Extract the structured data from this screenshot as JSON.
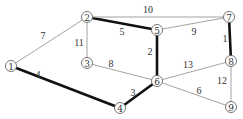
{
  "graph": {
    "nodes": [
      {
        "id": "1",
        "x": 11,
        "y": 66
      },
      {
        "id": "2",
        "x": 87,
        "y": 17
      },
      {
        "id": "3",
        "x": 87,
        "y": 63
      },
      {
        "id": "4",
        "x": 120,
        "y": 108
      },
      {
        "id": "5",
        "x": 157,
        "y": 30
      },
      {
        "id": "6",
        "x": 157,
        "y": 81
      },
      {
        "id": "7",
        "x": 229,
        "y": 17
      },
      {
        "id": "8",
        "x": 231,
        "y": 61
      },
      {
        "id": "9",
        "x": 231,
        "y": 107
      }
    ],
    "edges": [
      {
        "from": "1",
        "to": "2",
        "weight": "7",
        "highlighted": false,
        "lx": 43,
        "ly": 35
      },
      {
        "from": "1",
        "to": "4",
        "weight": "4",
        "highlighted": true,
        "lx": 38,
        "ly": 74
      },
      {
        "from": "2",
        "to": "3",
        "weight": "11",
        "highlighted": false,
        "lx": 79,
        "ly": 42
      },
      {
        "from": "2",
        "to": "5",
        "weight": "5",
        "highlighted": true,
        "lx": 122,
        "ly": 31
      },
      {
        "from": "2",
        "to": "7",
        "weight": "10",
        "highlighted": false,
        "lx": 148,
        "ly": 9
      },
      {
        "from": "3",
        "to": "6",
        "weight": "8",
        "highlighted": false,
        "lx": 111,
        "ly": 63
      },
      {
        "from": "4",
        "to": "6",
        "weight": "3",
        "highlighted": true,
        "lx": 133,
        "ly": 92
      },
      {
        "from": "5",
        "to": "6",
        "weight": "2",
        "highlighted": true,
        "lx": 150,
        "ly": 51
      },
      {
        "from": "5",
        "to": "7",
        "weight": "9",
        "highlighted": false,
        "lx": 194,
        "ly": 31
      },
      {
        "from": "6",
        "to": "8",
        "weight": "13",
        "highlighted": false,
        "lx": 188,
        "ly": 64
      },
      {
        "from": "6",
        "to": "9",
        "weight": "6",
        "highlighted": false,
        "lx": 199,
        "ly": 90
      },
      {
        "from": "7",
        "to": "8",
        "weight": "1",
        "highlighted": true,
        "lx": 225,
        "ly": 38
      },
      {
        "from": "8",
        "to": "9",
        "weight": "12",
        "highlighted": false,
        "lx": 222,
        "ly": 80
      }
    ]
  }
}
